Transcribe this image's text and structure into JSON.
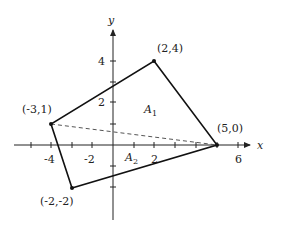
{
  "diagram": {
    "axes": {
      "x_label": "x",
      "y_label": "y",
      "x_tick_labels": [
        "-4",
        "-2",
        "2",
        "6"
      ],
      "y_tick_labels": [
        "4",
        "2"
      ]
    },
    "vertices": [
      {
        "label": "(2,4)",
        "x": 2,
        "y": 4
      },
      {
        "label": "(5,0)",
        "x": 5,
        "y": 0
      },
      {
        "label": "(-2,-2)",
        "x": -2,
        "y": -2
      },
      {
        "label": "(-3,1)",
        "x": -3,
        "y": 1
      }
    ],
    "regions": [
      {
        "name": "A",
        "sub": "1"
      },
      {
        "name": "A",
        "sub": "2"
      }
    ],
    "diagonal": {
      "from": "(-3,1)",
      "to": "(5,0)",
      "style": "dashed"
    }
  }
}
